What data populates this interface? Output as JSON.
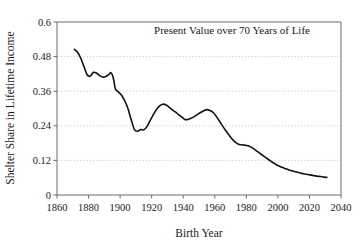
{
  "chart_data": {
    "type": "line",
    "title": "",
    "annotation": "Present Value over 70 Years of Life",
    "xlabel": "Birth Year",
    "ylabel": "Shelter Share in Lifetime Income",
    "xlim": [
      1860,
      2040
    ],
    "ylim": [
      0,
      0.6
    ],
    "xticks": [
      1860,
      1880,
      1900,
      1920,
      1940,
      1960,
      1980,
      2000,
      2020,
      2040
    ],
    "yticks": [
      0,
      0.12,
      0.24,
      0.36,
      0.48,
      0.6
    ],
    "xtick_labels": [
      "1860",
      "1880",
      "1900",
      "1920",
      "1940",
      "1960",
      "1980",
      "2000",
      "2020",
      "2040"
    ],
    "ytick_labels": [
      "0",
      "0.12",
      "0.24",
      "0.36",
      "0.48",
      "0.6"
    ],
    "grid": "horizontal-dotted",
    "legend": "none",
    "series": [
      {
        "name": "Shelter Share in Lifetime Income",
        "color": "#111111",
        "x": [
          1871,
          1873,
          1875,
          1877,
          1879,
          1881,
          1883,
          1885,
          1887,
          1889,
          1891,
          1893,
          1894,
          1895,
          1896,
          1897,
          1899,
          1901,
          1903,
          1905,
          1907,
          1909,
          1911,
          1913,
          1915,
          1917,
          1919,
          1921,
          1923,
          1925,
          1927,
          1929,
          1931,
          1933,
          1935,
          1937,
          1939,
          1941,
          1943,
          1945,
          1947,
          1949,
          1951,
          1953,
          1955,
          1957,
          1959,
          1961,
          1963,
          1965,
          1967,
          1969,
          1971,
          1973,
          1975,
          1977,
          1979,
          1981,
          1983,
          1985,
          1987,
          1989,
          1991,
          1993,
          1995,
          1997,
          1999,
          2001,
          2003,
          2005,
          2007,
          2009,
          2011,
          2013,
          2015,
          2017,
          2019,
          2021,
          2023,
          2025,
          2027,
          2029,
          2031
        ],
        "y": [
          0.505,
          0.495,
          0.475,
          0.447,
          0.418,
          0.412,
          0.425,
          0.423,
          0.414,
          0.409,
          0.411,
          0.418,
          0.425,
          0.418,
          0.398,
          0.368,
          0.357,
          0.345,
          0.326,
          0.299,
          0.262,
          0.228,
          0.221,
          0.227,
          0.226,
          0.237,
          0.258,
          0.278,
          0.296,
          0.309,
          0.315,
          0.313,
          0.305,
          0.296,
          0.288,
          0.279,
          0.271,
          0.262,
          0.262,
          0.266,
          0.272,
          0.279,
          0.286,
          0.292,
          0.296,
          0.293,
          0.286,
          0.272,
          0.256,
          0.239,
          0.223,
          0.208,
          0.194,
          0.183,
          0.176,
          0.174,
          0.173,
          0.171,
          0.166,
          0.159,
          0.151,
          0.143,
          0.135,
          0.127,
          0.119,
          0.112,
          0.105,
          0.1,
          0.095,
          0.091,
          0.087,
          0.084,
          0.081,
          0.078,
          0.075,
          0.073,
          0.071,
          0.069,
          0.067,
          0.065,
          0.064,
          0.062,
          0.061
        ]
      }
    ]
  },
  "figure": {
    "annotation_text": "Present Value over 70 Years of Life",
    "x_axis_title": "Birth Year",
    "y_axis_title": "Shelter Share in Lifetime Income"
  }
}
